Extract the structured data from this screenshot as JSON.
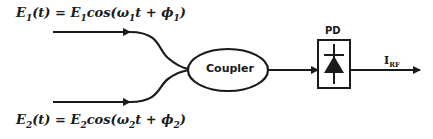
{
  "diagram": {
    "input1": {
      "lhs": "E",
      "lhs_sub": "1",
      "arg": "(t) = ",
      "amp": "E",
      "amp_sub": "1",
      "func": "cos(ω",
      "w_sub": "1",
      "mid": "t + ϕ",
      "p_sub": "1",
      "close": ")"
    },
    "input2": {
      "lhs": "E",
      "lhs_sub": "2",
      "arg": "(t) = ",
      "amp": "E",
      "amp_sub": "2",
      "func": "cos(ω",
      "w_sub": "2",
      "mid": "t + ϕ",
      "p_sub": "2",
      "close": ")"
    },
    "coupler_label": "Coupler",
    "pd_label": "PD",
    "output": {
      "main": "I",
      "sub": "RF"
    },
    "colors": {
      "stroke": "#1a1a1a",
      "background": "#ffffff"
    }
  }
}
